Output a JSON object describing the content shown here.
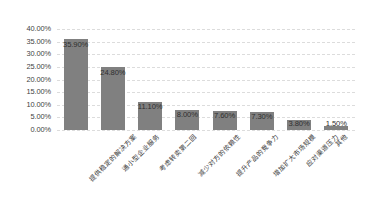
{
  "chart_data": {
    "type": "bar",
    "title": "",
    "subtitle": "",
    "xlabel": "",
    "ylabel": "",
    "ylim": [
      0,
      40
    ],
    "ytick_labels": [
      "40.00%",
      "35.00%",
      "30.00%",
      "25.00%",
      "20.00%",
      "15.00%",
      "10.00%",
      "5.00%",
      "0.00%"
    ],
    "ytick_values": [
      40,
      35,
      30,
      25,
      20,
      15,
      10,
      5,
      0
    ],
    "grid": true,
    "legend": "none",
    "bar_color": "#808080",
    "categories": [
      "提供稳定的解决方案",
      "通小型企业服务",
      "考虑转卖第二回",
      "减少对方的依赖性",
      "提升产品的竞争力",
      "增加扩大市场规模",
      "应对渠道压力",
      "其他"
    ],
    "values": [
      35.9,
      24.8,
      11.1,
      8.0,
      7.6,
      7.3,
      3.8,
      1.5
    ],
    "data_labels": [
      "35.90%",
      "24.80%",
      "11.10%",
      "8.00%",
      "7.60%",
      "7.30%",
      "3.80%",
      "1.50%"
    ]
  }
}
